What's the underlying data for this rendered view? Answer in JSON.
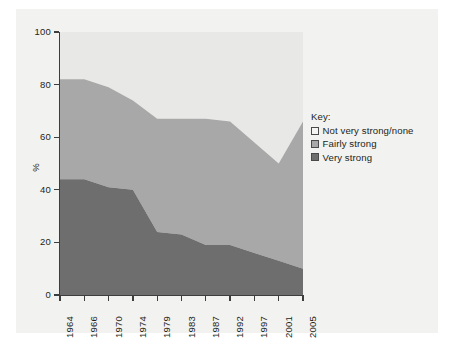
{
  "chart_data": {
    "type": "area",
    "title": "",
    "xlabel": "",
    "ylabel": "%",
    "stacked": true,
    "percent": true,
    "ylim": [
      0,
      100
    ],
    "yticks": [
      0,
      20,
      40,
      60,
      80,
      100
    ],
    "ytick_labels": [
      "0",
      "20",
      "40",
      "60",
      "80",
      "100"
    ],
    "grid": false,
    "legend_position": "right",
    "legend_title": "Key:",
    "categories": [
      "1964",
      "1966",
      "1970",
      "1974",
      "1979",
      "1983",
      "1987",
      "1992",
      "1997",
      "2001",
      "2005"
    ],
    "x": [
      1964,
      1966,
      1970,
      1974,
      1979,
      1983,
      1987,
      1992,
      1997,
      2001,
      2005
    ],
    "series": [
      {
        "name": "Very strong",
        "color": "#6e6e6e",
        "values": [
          44,
          44,
          41,
          40,
          24,
          23,
          19,
          19,
          16,
          13,
          10
        ]
      },
      {
        "name": "Fairly strong",
        "color": "#a8a8a8",
        "values": [
          38,
          38,
          38,
          34,
          43,
          44,
          48,
          47,
          42,
          37,
          56
        ]
      },
      {
        "name": "Not very strong/none",
        "color": "#e8e8e6",
        "values": [
          18,
          18,
          21,
          26,
          33,
          33,
          33,
          34,
          42,
          50,
          34
        ]
      }
    ],
    "cumulative_tops": {
      "very_strong": [
        44,
        44,
        41,
        40,
        24,
        23,
        19,
        19,
        16,
        13,
        10
      ],
      "fairly_strong_top": [
        82,
        82,
        79,
        74,
        67,
        67,
        67,
        66,
        58,
        50,
        66
      ]
    }
  },
  "legend": {
    "title": "Key:",
    "items": [
      {
        "label": "Not very strong/none",
        "color": "#f4f4f2"
      },
      {
        "label": "Fairly strong",
        "color": "#a8a8a8"
      },
      {
        "label": "Very strong",
        "color": "#6e6e6e"
      }
    ]
  },
  "axes": {
    "y_title": "%",
    "y_tick_labels": [
      "100",
      "80",
      "60",
      "40",
      "20",
      "0"
    ],
    "x_tick_labels": [
      "1964",
      "1966",
      "1970",
      "1974",
      "1979",
      "1983",
      "1987",
      "1992",
      "1997",
      "2001",
      "2005"
    ]
  },
  "colors": {
    "panel_background": "#f2f2f0",
    "axis": "#3d3d3d",
    "text": "#231f20",
    "very_strong": "#6e6e6e",
    "fairly_strong": "#a8a8a8",
    "not_very_strong": "#e8e8e6"
  }
}
